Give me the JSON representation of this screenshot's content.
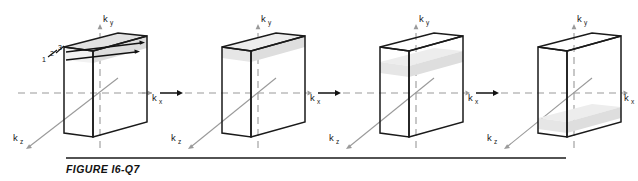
{
  "figure": {
    "caption": "FIGURE I6-Q7",
    "background_color": "#ffffff",
    "ink_color": "#1a1a1a",
    "axis_color": "#9a9a9a",
    "shade_color": "#e2e2e2",
    "rule_color": "#1a1a1a"
  },
  "axes": {
    "x_label": "k",
    "x_sub": "x",
    "y_label": "k",
    "y_sub": "y",
    "z_label": "k",
    "z_sub": "z"
  },
  "connectors": [
    {
      "name": "arrow-1-to-2",
      "glyph": "right-arrow"
    },
    {
      "name": "arrow-2-to-3",
      "glyph": "right-arrow"
    },
    {
      "name": "arrow-3-to-4",
      "glyph": "right-arrow"
    }
  ],
  "panels": [
    {
      "index": 1,
      "name": "panel-1",
      "shade_label": "top-slab-with-levels",
      "shade_position": "top",
      "level_numbers": [
        "1",
        "2",
        "3"
      ],
      "sweep_arrows": 2
    },
    {
      "index": 2,
      "name": "panel-2",
      "shade_label": "plane-at-top-face",
      "shade_position": "top",
      "level_numbers": [],
      "sweep_arrows": 0
    },
    {
      "index": 3,
      "name": "panel-3",
      "shade_label": "plane-below-top-face",
      "shade_position": "upper-middle",
      "level_numbers": [],
      "sweep_arrows": 0
    },
    {
      "index": 4,
      "name": "panel-4",
      "shade_label": "plane-near-bottom",
      "shade_position": "lower",
      "level_numbers": [],
      "sweep_arrows": 0
    }
  ]
}
